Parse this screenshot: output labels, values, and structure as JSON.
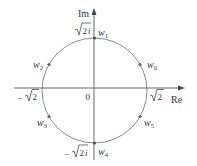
{
  "diagram": {
    "type": "complex-plane-roots",
    "axes": {
      "real_label": "Re",
      "imag_label": "Im",
      "origin_label": "0"
    },
    "circle": {
      "radius_label": "√2"
    },
    "axis_ticks": {
      "top": "√2i",
      "top_root": "√2",
      "top_suffix": "i",
      "bottom": "−√2i",
      "bottom_sign": "−",
      "bottom_root": "√2",
      "bottom_suffix": "i",
      "left": "−√2",
      "left_sign": "−",
      "left_root": "√2",
      "right": "√2",
      "right_root": "√2"
    },
    "points": [
      {
        "name": "w",
        "sub": "0",
        "angle_deg": 30
      },
      {
        "name": "w",
        "sub": "1",
        "angle_deg": 90
      },
      {
        "name": "w",
        "sub": "2",
        "angle_deg": 150
      },
      {
        "name": "w",
        "sub": "3",
        "angle_deg": 210
      },
      {
        "name": "w",
        "sub": "4",
        "angle_deg": 270
      },
      {
        "name": "w",
        "sub": "5",
        "angle_deg": 330
      }
    ],
    "colors": {
      "axis": "#555555",
      "circle": "#8a8a8a",
      "point": "#666666",
      "text": "#333333"
    }
  }
}
